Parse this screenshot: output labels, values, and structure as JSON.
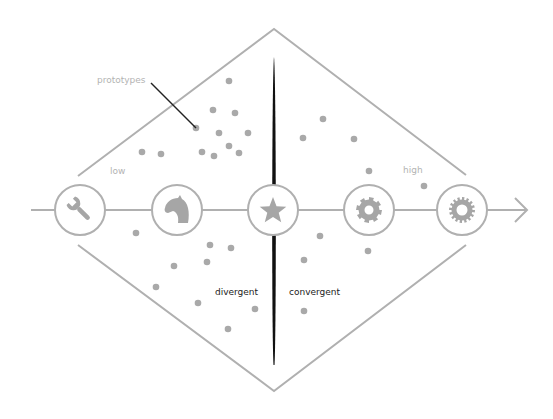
{
  "diagram": {
    "type": "divergent-convergent prototyping diamond",
    "colors": {
      "stroke": "#b0b0b0",
      "icon_fill": "#a6a6a6",
      "dot": "#a9a9a9",
      "divider": "#111111",
      "leader": "#222222",
      "muted_text": "#b3b3b3",
      "dark_text": "#222222",
      "background": "#ffffff"
    },
    "labels": {
      "prototypes": "prototypes",
      "low": "low",
      "high": "high",
      "divergent": "divergent",
      "convergent": "convergent"
    },
    "stages": [
      {
        "id": "tools",
        "icon": "wrench-icon",
        "cx": 80
      },
      {
        "id": "idea",
        "icon": "horse-head-icon",
        "cx": 177
      },
      {
        "id": "selection",
        "icon": "star-icon",
        "cx": 273
      },
      {
        "id": "engineering",
        "icon": "gear-icon",
        "cx": 369
      },
      {
        "id": "production",
        "icon": "cog-icon",
        "cx": 462
      }
    ],
    "axis": {
      "y": 210,
      "x_start": 31,
      "x_end": 527,
      "arrow": "arrow-right-icon"
    },
    "divider": {
      "x": 274,
      "y_top": 57,
      "y_bottom": 365
    },
    "diamond": {
      "top": [
        274,
        29
      ],
      "bottom": [
        274,
        391
      ],
      "left_upper_end": [
        78,
        176
      ],
      "left_lower_end": [
        78,
        245
      ],
      "right_upper_end": [
        466,
        175
      ],
      "right_lower_end": [
        466,
        245
      ]
    },
    "dots": [
      [
        229,
        81
      ],
      [
        213,
        110
      ],
      [
        235,
        113
      ],
      [
        196,
        128
      ],
      [
        219,
        133
      ],
      [
        248,
        133
      ],
      [
        142,
        152
      ],
      [
        161,
        154
      ],
      [
        202,
        152
      ],
      [
        214,
        156
      ],
      [
        229,
        146
      ],
      [
        239,
        153
      ],
      [
        303,
        138
      ],
      [
        323,
        119
      ],
      [
        354,
        139
      ],
      [
        369,
        171
      ],
      [
        424,
        186
      ],
      [
        136,
        233
      ],
      [
        210,
        245
      ],
      [
        231,
        248
      ],
      [
        174,
        266
      ],
      [
        207,
        262
      ],
      [
        156,
        287
      ],
      [
        198,
        303
      ],
      [
        255,
        309
      ],
      [
        228,
        329
      ],
      [
        320,
        236
      ],
      [
        304,
        260
      ],
      [
        368,
        251
      ],
      [
        304,
        311
      ]
    ],
    "prototype_pointer": {
      "from": [
        151,
        83
      ],
      "to": [
        196,
        128
      ]
    }
  }
}
